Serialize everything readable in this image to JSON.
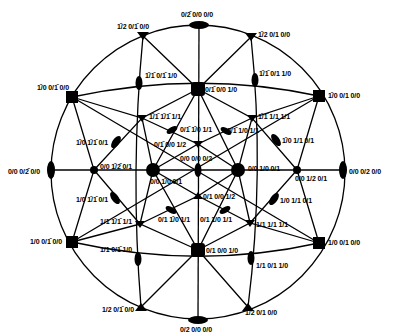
{
  "diagram": {
    "type": "stereographic-projection",
    "circle": {
      "cx": 198,
      "cy": 172,
      "rx": 158,
      "ry": 148
    },
    "colors": {
      "line": "#000000",
      "background": "#ffffff"
    },
    "nodes": [
      {
        "id": "top",
        "x": 199,
        "y": 25,
        "shape": "ellipse-h",
        "label": "0/2̄ 0/0 0/0",
        "lx": 181,
        "ly": 11
      },
      {
        "id": "bottom",
        "x": 198,
        "y": 320,
        "shape": "ellipse-h",
        "label": "0/2 0/0 0/0",
        "lx": 180,
        "ly": 326
      },
      {
        "id": "left",
        "x": 51,
        "y": 172,
        "shape": "ellipse-v",
        "label": "0/0 0/2̄ 0/0",
        "lx": 8,
        "ly": 168
      },
      {
        "id": "right",
        "x": 342,
        "y": 172,
        "shape": "ellipse-v",
        "label": "0/0 0/2 0/0",
        "lx": 349,
        "ly": 168
      },
      {
        "id": "tl-tri",
        "x": 143,
        "y": 36,
        "shape": "tri",
        "label": "1̄/2 0/1̄ 0/0",
        "lx": 117,
        "ly": 23
      },
      {
        "id": "tr-tri",
        "x": 251,
        "y": 37,
        "shape": "tri",
        "label": "1̄/2 0/1 0/0",
        "lx": 258,
        "ly": 31
      },
      {
        "id": "bl-tri",
        "x": 141,
        "y": 307,
        "shape": "tri",
        "label": "1/2 0/1̄ 0/0",
        "lx": 102,
        "ly": 306
      },
      {
        "id": "br-tri",
        "x": 248,
        "y": 307,
        "shape": "tri",
        "label": "1/2 0/1 0/0",
        "lx": 245,
        "ly": 309
      },
      {
        "id": "tl-sq",
        "x": 72,
        "y": 97,
        "shape": "sq",
        "label": "1̄/0 0/1̄ 0/0",
        "lx": 37,
        "ly": 84
      },
      {
        "id": "tr-sq",
        "x": 319,
        "y": 96,
        "shape": "sq",
        "label": "1̄/0 0/1 0/0",
        "lx": 328,
        "ly": 92
      },
      {
        "id": "bl-sq",
        "x": 72,
        "y": 242,
        "shape": "sq",
        "label": "1/0 0/1̄ 0/0",
        "lx": 30,
        "ly": 238
      },
      {
        "id": "br-sq",
        "x": 319,
        "y": 243,
        "shape": "sq",
        "label": "1/0 0/1 0/0",
        "lx": 328,
        "ly": 239
      },
      {
        "id": "t-ov-l",
        "x": 139,
        "y": 83,
        "shape": "ellipse-v",
        "label": "1̄/1̄ 0/1̄ 1/0",
        "lx": 145,
        "ly": 72
      },
      {
        "id": "t-ov-r",
        "x": 255,
        "y": 80,
        "shape": "ellipse-v",
        "label": "1̄/1̄ 0/1 1/0",
        "lx": 259,
        "ly": 70
      },
      {
        "id": "b-ov-l",
        "x": 138,
        "y": 259,
        "shape": "ellipse-v",
        "label": "1/1 0/1̄ 1/0",
        "lx": 100,
        "ly": 246
      },
      {
        "id": "b-ov-r",
        "x": 251,
        "y": 258,
        "shape": "ellipse-v",
        "label": "1/1 0/1 1/0",
        "lx": 256,
        "ly": 262
      },
      {
        "id": "center-top-sq",
        "x": 198,
        "y": 89,
        "shape": "sq-lg",
        "label": "0/1̄ 0/0 1/0",
        "lx": 205,
        "ly": 86
      },
      {
        "id": "center-bot-sq",
        "x": 198,
        "y": 250,
        "shape": "sq-lg",
        "label": "0/1 0/0 1/0",
        "lx": 206,
        "ly": 247
      },
      {
        "id": "c-left-big",
        "x": 153,
        "y": 170,
        "shape": "circle-lg",
        "label": "0/0 1̄/0 0/1",
        "lx": 150,
        "ly": 178
      },
      {
        "id": "c-right-big",
        "x": 238,
        "y": 170,
        "shape": "circle-lg",
        "label": "0/0 1/0 0/1",
        "lx": 248,
        "ly": 165
      },
      {
        "id": "mid-left-dot",
        "x": 94,
        "y": 170,
        "shape": "dot",
        "label": "0/0 1̄/2̄ 0/1",
        "lx": 100,
        "ly": 163
      },
      {
        "id": "mid-right-dot",
        "x": 297,
        "y": 170,
        "shape": "dot",
        "label": "0/0 1/2 0/1",
        "lx": 295,
        "ly": 175
      },
      {
        "id": "center-ov",
        "x": 198,
        "y": 170,
        "shape": "ellipse-v",
        "label": "0/0 0/0 0/2",
        "lx": 180,
        "ly": 155
      },
      {
        "id": "ul-tri",
        "x": 142,
        "y": 118,
        "shape": "tri",
        "label": "1̄/1̄ 1̄/1̄ 1/1",
        "lx": 149,
        "ly": 113
      },
      {
        "id": "ur-tri",
        "x": 252,
        "y": 118,
        "shape": "tri",
        "label": "1̄/1̄ 1/1 1/1",
        "lx": 258,
        "ly": 113
      },
      {
        "id": "ll-tri",
        "x": 140,
        "y": 224,
        "shape": "tri",
        "label": "1/1 1̄/1̄ 1/1",
        "lx": 100,
        "ly": 218
      },
      {
        "id": "lr-tri",
        "x": 250,
        "y": 223,
        "shape": "tri",
        "label": "1/1 1/1 1/1",
        "lx": 256,
        "ly": 221
      },
      {
        "id": "ov-ul",
        "x": 116,
        "y": 142,
        "shape": "ellipse-d1",
        "label": "1̄/0 1̄/1̄ 0/1",
        "lx": 76,
        "ly": 139
      },
      {
        "id": "ov-ur",
        "x": 276,
        "y": 140,
        "shape": "ellipse-d2",
        "label": "1̄/0 1/1 0/1",
        "lx": 282,
        "ly": 137
      },
      {
        "id": "ov-ll",
        "x": 115,
        "y": 198,
        "shape": "ellipse-d2",
        "label": "1/0 1̄/1̄ 0/1",
        "lx": 76,
        "ly": 196
      },
      {
        "id": "ov-lr",
        "x": 274,
        "y": 199,
        "shape": "ellipse-d1",
        "label": "1/0 1/1 0/1",
        "lx": 280,
        "ly": 197
      },
      {
        "id": "c-ul-ov",
        "x": 172,
        "y": 130,
        "shape": "ellipse-d1",
        "label": "0/1̄ 1̄/0 1/1",
        "lx": 180,
        "ly": 126
      },
      {
        "id": "c-ur-ov",
        "x": 226,
        "y": 131,
        "shape": "ellipse-d2",
        "label": "0/1̄ 1/0 1/1",
        "lx": 227,
        "ly": 127
      },
      {
        "id": "c-ll-ov",
        "x": 171,
        "y": 210,
        "shape": "ellipse-d2",
        "label": "0/1 1̄/0 1/1",
        "lx": 158,
        "ly": 216
      },
      {
        "id": "c-lr-ov",
        "x": 225,
        "y": 210,
        "shape": "ellipse-d1",
        "label": "0/1 1/0 1/1",
        "lx": 200,
        "ly": 216
      },
      {
        "id": "c-top-tri",
        "x": 198,
        "y": 144,
        "shape": "tri",
        "label": "0/1̄ 0/0 1/2",
        "lx": 154,
        "ly": 141
      },
      {
        "id": "c-bot-tri",
        "x": 198,
        "y": 196,
        "shape": "tri",
        "label": "0/1 0/0 1/2",
        "lx": 203,
        "ly": 193
      }
    ]
  }
}
